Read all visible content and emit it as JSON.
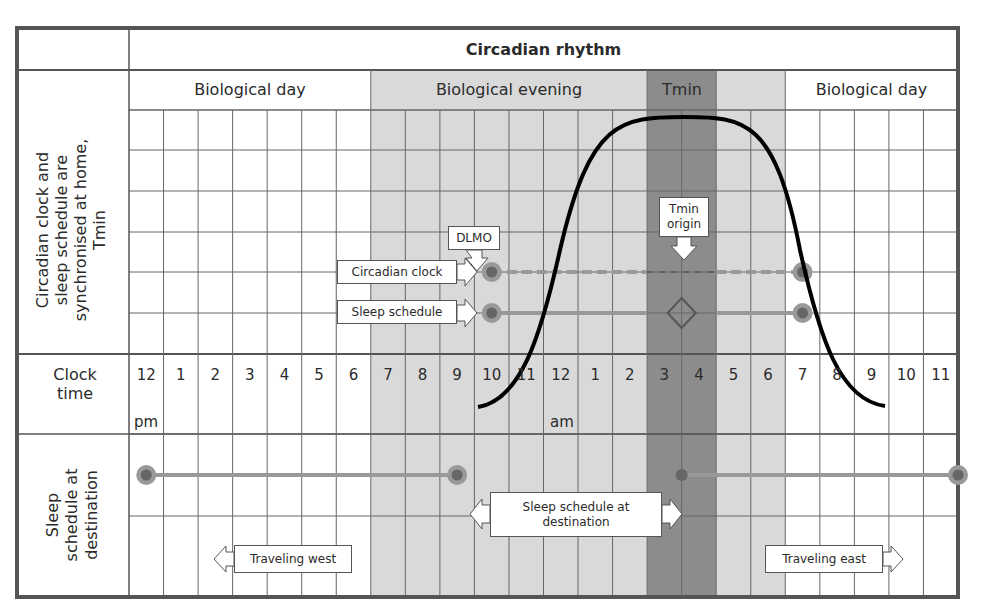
{
  "chart": {
    "title": "Circadian rhythm",
    "bands": [
      {
        "label": "Biological day",
        "from": 0,
        "to": 7,
        "shade": "none"
      },
      {
        "label": "Biological evening",
        "from": 7,
        "to": 15,
        "shade": "light"
      },
      {
        "label": "Tmin",
        "from": 15,
        "to": 17,
        "shade": "dark"
      },
      {
        "label": "",
        "from": 17,
        "to": 19,
        "shade": "light"
      },
      {
        "label": "Biological day",
        "from": 19,
        "to": 24,
        "shade": "none"
      }
    ],
    "row_labels": {
      "home": "Circadian clock  and sleep schedule are synchronised at home, Tmin",
      "clock": "Clock time",
      "destination": "Sleep schedule at destination"
    },
    "hours": [
      "12",
      "1",
      "2",
      "3",
      "4",
      "5",
      "6",
      "7",
      "8",
      "9",
      "10",
      "11",
      "12",
      "1",
      "2",
      "3",
      "4",
      "5",
      "6",
      "7",
      "8",
      "9",
      "10",
      "11"
    ],
    "pm_label": "pm",
    "am_label": "am",
    "callouts": {
      "dlmo": "DLMO",
      "tmin_origin": "Tmin origin",
      "circadian_clock": "Circadian clock",
      "sleep_schedule": "Sleep schedule",
      "sleep_schedule_destination": "Sleep schedule at destination",
      "traveling_west": "Traveling west",
      "traveling_east": "Traveling east"
    },
    "colors": {
      "frame": "#555555",
      "grid": "#666666",
      "light_shade": "#d9d9d9",
      "dark_shade": "#8c8c8c",
      "marker_outer": "#999999",
      "marker_inner": "#666666",
      "track": "#999999",
      "curve": "#000000"
    }
  },
  "chart_data": {
    "type": "diagram",
    "title": "Circadian rhythm",
    "x_axis": {
      "label": "Clock time",
      "ticks": [
        "12 pm",
        "1",
        "2",
        "3",
        "4",
        "5",
        "6",
        "7",
        "8",
        "9",
        "10",
        "11",
        "12 am",
        "1",
        "2",
        "3",
        "4",
        "5",
        "6",
        "7",
        "8",
        "9",
        "10",
        "11"
      ]
    },
    "phases": [
      {
        "name": "Biological day",
        "start": "12 pm",
        "end": "7 pm"
      },
      {
        "name": "Biological evening",
        "start": "7 pm",
        "end": "3 am"
      },
      {
        "name": "Tmin",
        "start": "3 am",
        "end": "5 am"
      },
      {
        "name": "Biological day",
        "start": "7 am",
        "end": "12 pm"
      }
    ],
    "home": {
      "circadian_clock": {
        "start": "10:30 pm",
        "end": "7:30 am",
        "style": "dashed"
      },
      "sleep_schedule": {
        "start": "10:30 pm",
        "end": "7:30 am",
        "style": "solid"
      },
      "dlmo": "~10 pm",
      "tmin_origin": "~4 am"
    },
    "curve": {
      "description": "Melatonin/sleep propensity curve rising from ~10 pm, peaking ~3-5 am, falling by ~9 am"
    },
    "destination": {
      "sleep_schedule_west": {
        "start": "12:30 pm",
        "end": "9:30 pm"
      },
      "sleep_schedule_east": {
        "start": "4 am",
        "end": "12 pm"
      },
      "annotations": [
        "Traveling west",
        "Traveling east",
        "Sleep schedule at destination"
      ]
    }
  }
}
